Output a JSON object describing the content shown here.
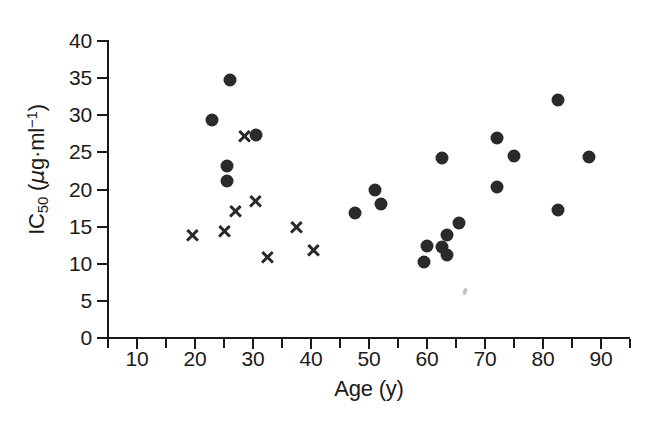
{
  "figure": {
    "width": 646,
    "height": 425,
    "background": "#ffffff",
    "marker_color": "#2a2a2a",
    "axis_color": "#1a1a1a"
  },
  "axes": {
    "x_title": "Age (y)",
    "y_title_main": "IC",
    "y_title_sub": "50",
    "y_title_units_open": " (",
    "y_title_mu": "μ",
    "y_title_units": "g·ml",
    "y_title_exp": "−1",
    "y_title_close": ")",
    "x_tick_labels": [
      "10",
      "20",
      "30",
      "40",
      "50",
      "60",
      "70",
      "80",
      "90"
    ],
    "y_tick_labels": [
      "0",
      "5",
      "10",
      "15",
      "20",
      "25",
      "30",
      "35",
      "40"
    ]
  },
  "artifacts": {
    "speck_label": "scan-speck"
  },
  "chart_data": {
    "type": "scatter",
    "title": "",
    "xlabel": "Age (y)",
    "ylabel": "IC50 (μg·ml−1)",
    "xlim": [
      5,
      95
    ],
    "ylim": [
      0,
      40
    ],
    "x_ticks": [
      10,
      20,
      30,
      40,
      50,
      60,
      70,
      80,
      90
    ],
    "x_minor_ticks": [
      5,
      15,
      25,
      35,
      45,
      55,
      65,
      75,
      85,
      95
    ],
    "y_ticks": [
      0,
      5,
      10,
      15,
      20,
      25,
      30,
      35,
      40
    ],
    "grid": false,
    "legend": false,
    "legend_position": "none",
    "series": [
      {
        "name": "filled-circle",
        "marker": "circle",
        "color": "#2a2a2a",
        "points": [
          {
            "x": 23.0,
            "y": 29.3
          },
          {
            "x": 25.5,
            "y": 23.2
          },
          {
            "x": 25.5,
            "y": 21.2
          },
          {
            "x": 26.0,
            "y": 34.8
          },
          {
            "x": 30.5,
            "y": 27.4
          },
          {
            "x": 47.5,
            "y": 16.9
          },
          {
            "x": 51.0,
            "y": 19.9
          },
          {
            "x": 52.0,
            "y": 18.1
          },
          {
            "x": 59.5,
            "y": 10.2
          },
          {
            "x": 60.0,
            "y": 12.4
          },
          {
            "x": 62.5,
            "y": 12.3
          },
          {
            "x": 62.5,
            "y": 24.3
          },
          {
            "x": 63.5,
            "y": 11.2
          },
          {
            "x": 63.5,
            "y": 13.9
          },
          {
            "x": 65.5,
            "y": 15.5
          },
          {
            "x": 72.0,
            "y": 27.0
          },
          {
            "x": 72.0,
            "y": 20.4
          },
          {
            "x": 75.0,
            "y": 24.5
          },
          {
            "x": 82.5,
            "y": 32.0
          },
          {
            "x": 82.5,
            "y": 17.2
          },
          {
            "x": 88.0,
            "y": 24.4
          }
        ]
      },
      {
        "name": "cross",
        "marker": "x",
        "color": "#2a2a2a",
        "points": [
          {
            "x": 19.5,
            "y": 13.8
          },
          {
            "x": 25.0,
            "y": 14.4
          },
          {
            "x": 27.0,
            "y": 17.0
          },
          {
            "x": 28.5,
            "y": 27.2
          },
          {
            "x": 30.5,
            "y": 18.4
          },
          {
            "x": 32.5,
            "y": 10.9
          },
          {
            "x": 37.5,
            "y": 14.9
          },
          {
            "x": 40.5,
            "y": 11.8
          }
        ]
      }
    ]
  }
}
